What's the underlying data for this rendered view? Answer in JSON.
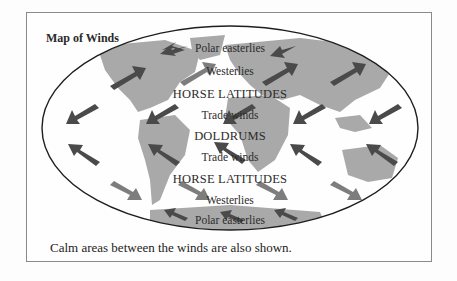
{
  "map": {
    "title": "Map of Winds",
    "caption": "Calm areas between the winds are also shown.",
    "colors": {
      "land": "#a9a9a9",
      "arrow_dark": "#4a4a4a",
      "arrow_light": "#7d7d7d",
      "outline": "#1e1e1e",
      "frame": "#8a8a8a"
    },
    "bands": [
      {
        "label": "Polar easterlies",
        "y": 42
      },
      {
        "label": "Westerlies",
        "y": 65
      },
      {
        "label": "HORSE LATITUDES",
        "y": 87,
        "caps": true
      },
      {
        "label": "Trade winds",
        "y": 109
      },
      {
        "label": "DOLDRUMS",
        "y": 129,
        "caps": true
      },
      {
        "label": "Trade winds",
        "y": 151
      },
      {
        "label": "HORSE LATITUDES",
        "y": 172,
        "caps": true
      },
      {
        "label": "Westerlies",
        "y": 194
      },
      {
        "label": "Polar easterlies",
        "y": 214
      }
    ]
  }
}
